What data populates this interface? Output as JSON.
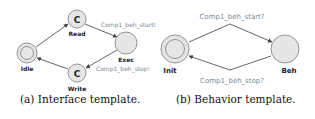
{
  "figure_a": {
    "caption": "(a) Interface template.",
    "states": {
      "idle": {
        "label": "Idle",
        "initial": true
      },
      "read": {
        "label": "Read",
        "committed_mark": "C"
      },
      "exec": {
        "label": "Exec"
      },
      "write": {
        "label": "Write",
        "committed_mark": "C"
      }
    },
    "edges": {
      "exec_in": "Comp1_beh_start!",
      "exec_out": "Comp1_beh_stop!"
    }
  },
  "figure_b": {
    "caption": "(b) Behavior template.",
    "states": {
      "init": {
        "label": "Init",
        "initial": true
      },
      "beh": {
        "label": "Beh"
      }
    },
    "edges": {
      "start": "Comp1_beh_start?",
      "stop": "Comp1_beh_stop?"
    }
  },
  "colors": {
    "state_fill": "#e6e6e6",
    "state_stroke": "#8a8a8a",
    "edge": "#555555",
    "edge_label": "#7a8a96"
  }
}
